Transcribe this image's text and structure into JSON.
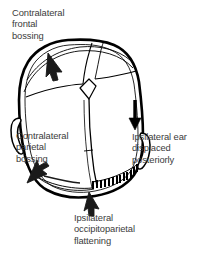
{
  "figure": {
    "name": "positional-plagiocephaly-vertex-view",
    "view": "vertex (top-down) view of infant skull showing parallelogram deformity",
    "background_color": "#ffffff",
    "line_color": "#000000",
    "text_color": "#3b3b3b"
  },
  "labels": {
    "frontal_bossing": {
      "line1": "Contralateral",
      "line2": "frontal",
      "line3": "bossing"
    },
    "parietal_bossing": {
      "line1": "Contralateral",
      "line2": "parietal",
      "line3": "bossing"
    },
    "ear_displaced": {
      "line1": "Ipsilateral ear",
      "line2": "displaced",
      "line3": "posteriorly"
    },
    "occipitoparietal_flattening": {
      "line1": "Ipsilateral",
      "line2": "occipitoparietal",
      "line3": "flattening"
    }
  },
  "annotations": {
    "arrow_frontal": "cursor-arrow-pointing-up-left",
    "arrow_parietal": "cursor-arrow-pointing-down-left",
    "arrow_ear": "straight-down-arrow",
    "arrow_flattening": "cursor-arrow-pointing-up-left",
    "hatching": "dashed-hatch-marks-indicating-flattened-occipitoparietal-region"
  },
  "anatomy": {
    "skull_outline": "asymmetric-skull-outline",
    "inner_skull_outline": "inner-skull-contour",
    "sagittal_suture": "sagittal-suture",
    "coronal_suture": "coronal-suture",
    "metopic_suture": "metopic-suture",
    "lambdoid_suture": "lambdoid-suture",
    "anterior_fontanelle": "anterior-fontanelle",
    "left_ear": "contralateral-ear",
    "right_ear": "ipsilateral-ear"
  }
}
